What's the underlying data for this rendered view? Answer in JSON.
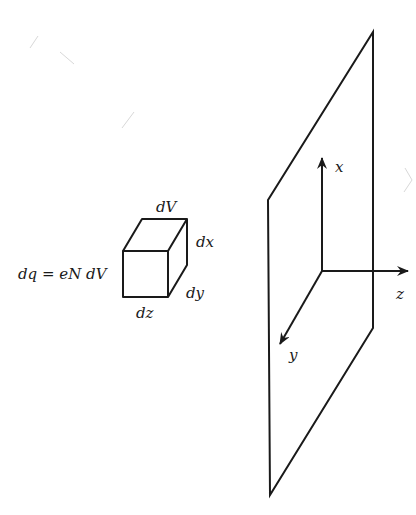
{
  "diagram": {
    "type": "charge-volume-element-and-plane",
    "colors": {
      "line": "#1a1a1a",
      "background": "#ffffff",
      "artifact": "#d8d8d8"
    },
    "volume_element": {
      "equation": "dq = eN dV",
      "labels": {
        "top": "dV",
        "right_vertical": "dx",
        "right_depth": "dy",
        "bottom": "dz"
      }
    },
    "plane": {
      "description": "infinite charged sheet shown as parallelogram"
    },
    "axes": {
      "x": "x",
      "y": "y",
      "z": "z"
    }
  }
}
